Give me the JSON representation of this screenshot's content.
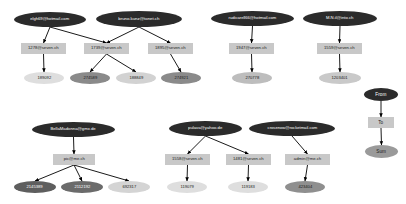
{
  "diagram": {
    "type": "directed-graph",
    "colors": {
      "source_fill": "#2b2b2b",
      "source_text": "#ffffff",
      "box_fill": "#c8c8c8",
      "box_text": "#1a1a1a",
      "sum_light": "#d9d9d9",
      "sum_mid": "#a8a8a8",
      "sum_dark": "#6e6e6e",
      "sum_darker": "#555555",
      "edge": "#000000",
      "background": "#ffffff"
    }
  },
  "legend": {
    "name": "legend-column",
    "items": [
      {
        "label": "From",
        "shape": "ellipse",
        "fill": "#2b2b2b",
        "text": "#ffffff"
      },
      {
        "label": "To",
        "shape": "box",
        "fill": "#c8c8c8",
        "text": "#1a1a1a"
      },
      {
        "label": "Sum",
        "shape": "ellipse",
        "fill": "#9a9a9a",
        "text": "#1a1a1a"
      }
    ]
  },
  "nodes": [
    {
      "id": "n1",
      "label": "elgh69@hotmail.com",
      "kind": "from",
      "x": 14,
      "y": 12,
      "w": 72,
      "h": 15,
      "fill": "#2b2b2b",
      "text": "#ffffff",
      "fs": 4.4
    },
    {
      "id": "n2",
      "label": "bruno.kunz@tonet.ch",
      "kind": "from",
      "x": 96,
      "y": 11,
      "w": 86,
      "h": 16,
      "fill": "#2b2b2b",
      "text": "#ffffff",
      "fs": 4.6
    },
    {
      "id": "n3",
      "label": "rudicarell66@hotmail.com",
      "kind": "from",
      "x": 211,
      "y": 11,
      "w": 83,
      "h": 15,
      "fill": "#2b2b2b",
      "text": "#ffffff",
      "fs": 4.4
    },
    {
      "id": "n4",
      "label": "M.N.il@into.ch",
      "kind": "from",
      "x": 303,
      "y": 11,
      "w": 74,
      "h": 15,
      "fill": "#2b2b2b",
      "text": "#ffffff",
      "fs": 4.5
    },
    {
      "id": "n5",
      "label": "1278@seven.ch",
      "kind": "to",
      "x": 21,
      "y": 43,
      "w": 45,
      "h": 11,
      "fill": "#c8c8c8",
      "text": "#1a1a1a",
      "fs": 4.5
    },
    {
      "id": "n6",
      "label": "1739@seven.ch",
      "kind": "to",
      "x": 84,
      "y": 43,
      "w": 45,
      "h": 11,
      "fill": "#c8c8c8",
      "text": "#1a1a1a",
      "fs": 4.5
    },
    {
      "id": "n7",
      "label": "1895@seven.ch",
      "kind": "to",
      "x": 148,
      "y": 43,
      "w": 45,
      "h": 11,
      "fill": "#c8c8c8",
      "text": "#1a1a1a",
      "fs": 4.5
    },
    {
      "id": "n8",
      "label": "1947@seven.ch",
      "kind": "to",
      "x": 229,
      "y": 43,
      "w": 45,
      "h": 11,
      "fill": "#c8c8c8",
      "text": "#1a1a1a",
      "fs": 4.5
    },
    {
      "id": "n9",
      "label": "1559@seven.ch",
      "kind": "to",
      "x": 317,
      "y": 43,
      "w": 45,
      "h": 11,
      "fill": "#c8c8c8",
      "text": "#1a1a1a",
      "fs": 4.5
    },
    {
      "id": "n10",
      "label": "189092",
      "kind": "sum",
      "x": 24,
      "y": 72,
      "w": 40,
      "h": 12,
      "fill": "#dedede",
      "text": "#1a1a1a",
      "fs": 4.4
    },
    {
      "id": "n11",
      "label": "274589",
      "kind": "sum",
      "x": 70,
      "y": 72,
      "w": 40,
      "h": 12,
      "fill": "#8a8a8a",
      "text": "#1a1a1a",
      "fs": 4.4
    },
    {
      "id": "n12",
      "label": "188849",
      "kind": "sum",
      "x": 116,
      "y": 72,
      "w": 40,
      "h": 12,
      "fill": "#d2d2d2",
      "text": "#1a1a1a",
      "fs": 4.4
    },
    {
      "id": "n13",
      "label": "274921",
      "kind": "sum",
      "x": 161,
      "y": 72,
      "w": 40,
      "h": 12,
      "fill": "#8a8a8a",
      "text": "#1a1a1a",
      "fs": 4.4
    },
    {
      "id": "n14",
      "label": "270778",
      "kind": "sum",
      "x": 232,
      "y": 72,
      "w": 40,
      "h": 12,
      "fill": "#bdbdbd",
      "text": "#1a1a1a",
      "fs": 4.4
    },
    {
      "id": "n15",
      "label": "1203401",
      "kind": "sum",
      "x": 319,
      "y": 72,
      "w": 42,
      "h": 12,
      "fill": "#c9c9c9",
      "text": "#1a1a1a",
      "fs": 4.4
    },
    {
      "id": "n16",
      "label": "BellaMadonna@gmx.de",
      "kind": "from",
      "x": 32,
      "y": 122,
      "w": 83,
      "h": 15,
      "fill": "#2b2b2b",
      "text": "#ffffff",
      "fs": 4.5
    },
    {
      "id": "n17",
      "label": "pulava@yahoo.de",
      "kind": "from",
      "x": 169,
      "y": 121,
      "w": 73,
      "h": 15,
      "fill": "#2b2b2b",
      "text": "#ffffff",
      "fs": 4.5
    },
    {
      "id": "n18",
      "label": "crosenow@rocketmail.com",
      "kind": "from",
      "x": 249,
      "y": 121,
      "w": 86,
      "h": 15,
      "fill": "#2b2b2b",
      "text": "#ffffff",
      "fs": 4.4
    },
    {
      "id": "n19",
      "label": "pic@me.ch",
      "kind": "to",
      "x": 53,
      "y": 154,
      "w": 42,
      "h": 11,
      "fill": "#c8c8c8",
      "text": "#1a1a1a",
      "fs": 4.5
    },
    {
      "id": "n20",
      "label": "1558@seven.ch",
      "kind": "to",
      "x": 165,
      "y": 154,
      "w": 45,
      "h": 11,
      "fill": "#c8c8c8",
      "text": "#1a1a1a",
      "fs": 4.5
    },
    {
      "id": "n21",
      "label": "1481@seven.ch",
      "kind": "to",
      "x": 226,
      "y": 154,
      "w": 45,
      "h": 11,
      "fill": "#c8c8c8",
      "text": "#1a1a1a",
      "fs": 4.5
    },
    {
      "id": "n22",
      "label": "admin@me.ch",
      "kind": "to",
      "x": 285,
      "y": 154,
      "w": 45,
      "h": 11,
      "fill": "#c8c8c8",
      "text": "#1a1a1a",
      "fs": 4.5
    },
    {
      "id": "n23",
      "label": "2145389",
      "kind": "sum",
      "x": 14,
      "y": 181,
      "w": 42,
      "h": 12,
      "fill": "#5e5e5e",
      "text": "#ffffff",
      "fs": 4.4
    },
    {
      "id": "n24",
      "label": "2112192",
      "kind": "sum",
      "x": 61,
      "y": 181,
      "w": 42,
      "h": 12,
      "fill": "#6b6b6b",
      "text": "#ffffff",
      "fs": 4.4
    },
    {
      "id": "n25",
      "label": "692317",
      "kind": "sum",
      "x": 108,
      "y": 181,
      "w": 42,
      "h": 12,
      "fill": "#d4d4d4",
      "text": "#1a1a1a",
      "fs": 4.4
    },
    {
      "id": "n26",
      "label": "119079",
      "kind": "sum",
      "x": 167,
      "y": 181,
      "w": 40,
      "h": 12,
      "fill": "#dedede",
      "text": "#1a1a1a",
      "fs": 4.4
    },
    {
      "id": "n27",
      "label": "119183",
      "kind": "sum",
      "x": 228,
      "y": 181,
      "w": 40,
      "h": 12,
      "fill": "#dedede",
      "text": "#1a1a1a",
      "fs": 4.4
    },
    {
      "id": "n28",
      "label": "423404",
      "kind": "sum",
      "x": 285,
      "y": 181,
      "w": 40,
      "h": 12,
      "fill": "#8f8f8f",
      "text": "#1a1a1a",
      "fs": 4.4
    },
    {
      "id": "L1",
      "label": "From",
      "kind": "from",
      "x": 364,
      "y": 88,
      "w": 34,
      "h": 13,
      "fill": "#2b2b2b",
      "text": "#ffffff",
      "fs": 5.0
    },
    {
      "id": "L2",
      "label": "To",
      "kind": "to",
      "x": 368,
      "y": 117,
      "w": 26,
      "h": 11,
      "fill": "#c8c8c8",
      "text": "#1a1a1a",
      "fs": 5.0
    },
    {
      "id": "L3",
      "label": "Sum",
      "kind": "sum",
      "x": 365,
      "y": 145,
      "w": 33,
      "h": 13,
      "fill": "#9a9a9a",
      "text": "#1a1a1a",
      "fs": 5.0
    }
  ],
  "edges": [
    {
      "from": "n1",
      "to": "n5"
    },
    {
      "from": "n1",
      "to": "n6"
    },
    {
      "from": "n2",
      "to": "n6"
    },
    {
      "from": "n2",
      "to": "n7"
    },
    {
      "from": "n5",
      "to": "n10"
    },
    {
      "from": "n6",
      "to": "n11"
    },
    {
      "from": "n6",
      "to": "n12"
    },
    {
      "from": "n7",
      "to": "n13"
    },
    {
      "from": "n3",
      "to": "n8"
    },
    {
      "from": "n8",
      "to": "n14"
    },
    {
      "from": "n4",
      "to": "n9"
    },
    {
      "from": "n9",
      "to": "n15"
    },
    {
      "from": "n16",
      "to": "n19"
    },
    {
      "from": "n19",
      "to": "n23"
    },
    {
      "from": "n19",
      "to": "n24"
    },
    {
      "from": "n19",
      "to": "n25"
    },
    {
      "from": "n17",
      "to": "n20"
    },
    {
      "from": "n17",
      "to": "n21"
    },
    {
      "from": "n18",
      "to": "n22"
    },
    {
      "from": "n20",
      "to": "n26"
    },
    {
      "from": "n21",
      "to": "n27"
    },
    {
      "from": "n22",
      "to": "n28"
    },
    {
      "from": "L1",
      "to": "L2"
    },
    {
      "from": "L2",
      "to": "L3"
    }
  ]
}
